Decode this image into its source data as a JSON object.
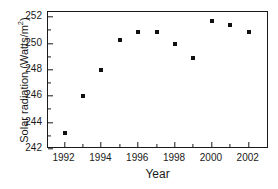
{
  "chart_data": {
    "type": "scatter",
    "title": "",
    "xlabel": "Year",
    "ylabel": "Solar radiation (Watts/m",
    "ylabel_sup": "2",
    "ylabel_tail": ")",
    "x": [
      1992,
      1993,
      1994,
      1995,
      1996,
      1997,
      1998,
      1999,
      2000,
      2001,
      2002
    ],
    "values": [
      243.2,
      246.0,
      248.0,
      250.3,
      250.9,
      250.9,
      250.0,
      248.9,
      251.7,
      251.4,
      250.9
    ],
    "series": [
      {
        "name": "Solar radiation",
        "points": [
          {
            "x": 1992,
            "y": 243.2
          },
          {
            "x": 1993,
            "y": 246.0
          },
          {
            "x": 1994,
            "y": 248.0
          },
          {
            "x": 1995,
            "y": 250.3
          },
          {
            "x": 1996,
            "y": 250.9
          },
          {
            "x": 1997,
            "y": 250.9
          },
          {
            "x": 1998,
            "y": 250.0
          },
          {
            "x": 1999,
            "y": 248.9
          },
          {
            "x": 2000,
            "y": 251.7
          },
          {
            "x": 2001,
            "y": 251.4
          },
          {
            "x": 2002,
            "y": 250.9
          }
        ]
      }
    ],
    "xlim": [
      1991.1,
      2003.1
    ],
    "ylim": [
      242.0,
      252.4
    ],
    "xticks": [
      1992,
      1994,
      1996,
      1998,
      2000,
      2002
    ],
    "xticklabels": [
      "1992",
      "1994",
      "1996",
      "1998",
      "2000",
      "2002"
    ],
    "xticks_minor": [
      1993,
      1995,
      1997,
      1999,
      2001
    ],
    "yticks": [
      242,
      244,
      246,
      248,
      250,
      252
    ],
    "yticklabels": [
      "242",
      "244",
      "246",
      "248",
      "250",
      "252"
    ],
    "yticks_minor": [
      243,
      245,
      247,
      249,
      251
    ],
    "grid": false,
    "legend": false,
    "marker": "square",
    "marker_color": "#111111",
    "frame_color": "#1a1a1a",
    "background": "#ffffff"
  }
}
